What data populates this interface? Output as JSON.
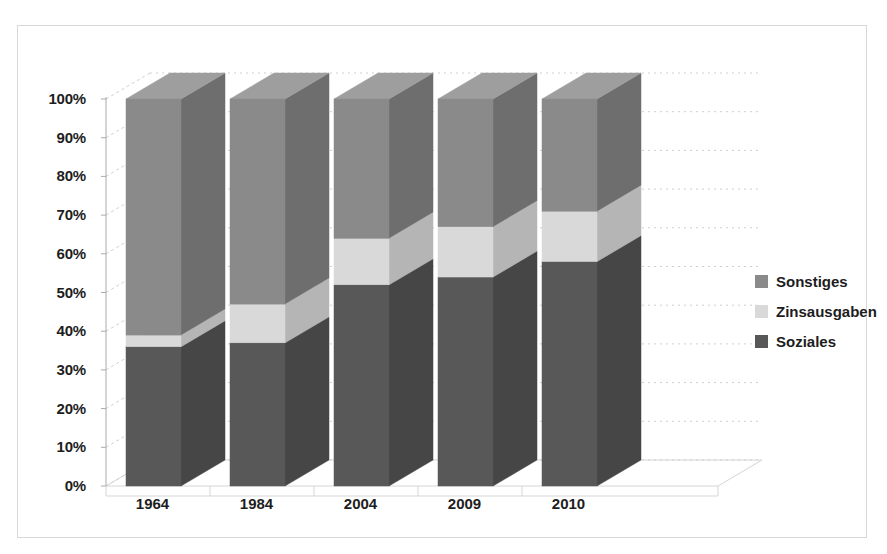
{
  "chart_data": {
    "type": "bar",
    "subtype": "stacked-100-percent-3d",
    "title": "",
    "xlabel": "",
    "ylabel": "",
    "categories": [
      "1964",
      "1984",
      "2004",
      "2009",
      "2010"
    ],
    "series": [
      {
        "name": "Soziales",
        "color": "#585858",
        "side_color": "#464646",
        "top_color": "#6b6b6b",
        "values": [
          36,
          37,
          52,
          54,
          58
        ]
      },
      {
        "name": "Zinsausgaben",
        "color": "#d9d9d9",
        "side_color": "#b5b5b5",
        "top_color": "#e8e8e8",
        "values": [
          3,
          10,
          12,
          13,
          13
        ]
      },
      {
        "name": "Sonstiges",
        "color": "#8a8a8a",
        "side_color": "#6e6e6e",
        "top_color": "#9e9e9e",
        "values": [
          61,
          53,
          36,
          33,
          29
        ]
      }
    ],
    "ylim": [
      0,
      100
    ],
    "yticks": [
      "0%",
      "10%",
      "20%",
      "30%",
      "40%",
      "50%",
      "60%",
      "70%",
      "80%",
      "90%",
      "100%"
    ],
    "ytick_values": [
      0,
      10,
      20,
      30,
      40,
      50,
      60,
      70,
      80,
      90,
      100
    ],
    "grid": true,
    "gridline_color": "#d0d0d0",
    "legend_position": "right",
    "legend_entries": [
      {
        "label": "Sonstiges",
        "color": "#8a8a8a"
      },
      {
        "label": "Zinsausgaben",
        "color": "#d9d9d9"
      },
      {
        "label": "Soziales",
        "color": "#585858"
      }
    ],
    "stack_order_bottom_to_top": [
      "Soziales",
      "Zinsausgaben",
      "Sonstiges"
    ],
    "background_color": "#ffffff",
    "border_color": "#d8d8d8",
    "axis_color": "#aaaaaa"
  }
}
